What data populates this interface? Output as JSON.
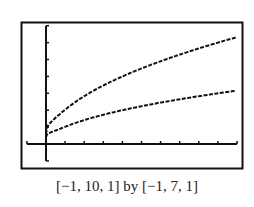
{
  "caption": "[−1, 10, 1] by [−1, 7, 1]",
  "chart_data": {
    "type": "line",
    "title": "",
    "xlabel": "",
    "ylabel": "",
    "xlim": [
      -1,
      10
    ],
    "ylim": [
      -1,
      7
    ],
    "xscl": 1,
    "yscl": 1,
    "grid": false,
    "series": [
      {
        "name": "upper curve (y = 2√x)",
        "x": [
          0,
          0.25,
          1,
          2,
          3,
          4,
          5,
          6,
          7,
          8,
          9,
          10
        ],
        "values": [
          0,
          1,
          2,
          2.83,
          3.46,
          4,
          4.47,
          4.9,
          5.29,
          5.66,
          6,
          6.32
        ]
      },
      {
        "name": "lower curve (y = √x)",
        "x": [
          0,
          0.25,
          1,
          2,
          3,
          4,
          5,
          6,
          7,
          8,
          9,
          10
        ],
        "values": [
          0,
          0.5,
          1,
          1.41,
          1.73,
          2,
          2.24,
          2.45,
          2.65,
          2.83,
          3,
          3.16
        ]
      }
    ]
  },
  "colors": {
    "line": "#111111",
    "frame": "#111111"
  }
}
